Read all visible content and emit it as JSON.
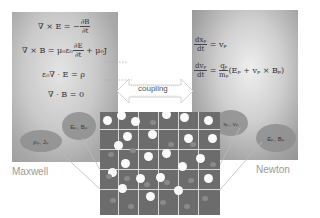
{
  "maxwell": {
    "name": "Maxwell",
    "equations": [
      "∇ × E = −∂B/∂t",
      "∇ × B = μ0ε0 ∂E/∂t + μ0J",
      "ε0∇ · E = ρ",
      "∇ · B = 0"
    ],
    "eq1_lhs": "∇ × E = −",
    "eq1_num": "∂B",
    "eq1_den": "∂t",
    "eq2_lhs": "∇ × B = μ₀ε₀",
    "eq2_num": "∂E",
    "eq2_den": "∂t",
    "eq2_rhs": "+ μ₀J",
    "eq3": "ε₀∇ · E = ρ",
    "eq4": "∇ · B = 0",
    "oval_fields": "Eₚ, Bₚ",
    "oval_sources": "ρₚ, Jₚ"
  },
  "newton": {
    "name": "Newton",
    "eq1_num": "dxₚ",
    "eq1_den": "dt",
    "eq1_rhs": "= vₚ",
    "eq2_num": "dvₚ",
    "eq2_den": "dt",
    "eq2_mid": "=",
    "eq2_qnum": "qₚ",
    "eq2_qden": "mₚ",
    "eq2_rhs": "(Eₚ + vₚ × Bₚ)",
    "oval_state": "xₚ, vₚ",
    "oval_fields": "Eₚ, Bₚ"
  },
  "coupling": {
    "label": "coupling"
  },
  "colors": {
    "panel_gray": "#b5b5b5",
    "grid_bg": "#6c6c6c",
    "grid_line": "#d8d8d8",
    "particle": "#fafafa",
    "label": "#9a9a9a"
  }
}
